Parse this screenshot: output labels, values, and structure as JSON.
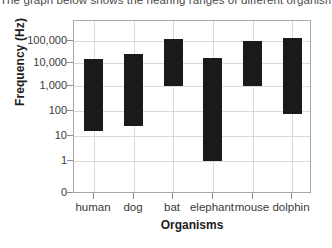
{
  "caption": {
    "text": "The graph below shows the hearing ranges of different organisms."
  },
  "chart_data": {
    "type": "bar",
    "title": "",
    "subtitle": "",
    "xlabel": "Organisms",
    "ylabel": "Frequency (Hz)",
    "categories": [
      "human",
      "dog",
      "bat",
      "elephant",
      "mouse",
      "dolphin"
    ],
    "series": [
      {
        "name": "Hearing range (Hz)",
        "ranges": [
          {
            "category": "human",
            "low": 16,
            "high": 16000
          },
          {
            "category": "dog",
            "low": 25,
            "high": 25000
          },
          {
            "category": "bat",
            "low": 1000,
            "high": 120000
          },
          {
            "category": "elephant",
            "low": 1,
            "high": 17000
          },
          {
            "category": "mouse",
            "low": 1000,
            "high": 100000
          },
          {
            "category": "dolphin",
            "low": 70,
            "high": 130000
          }
        ]
      }
    ],
    "yscale": "log-with-zero",
    "ytick_labels": [
      "100,000",
      "10,000",
      "1,000",
      "100",
      "10",
      "1",
      "0"
    ],
    "ytick_values": [
      100000,
      10000,
      1000,
      100,
      10,
      1,
      0
    ],
    "ylim": [
      0,
      400000
    ],
    "grid": true,
    "legend": "none",
    "bar_color": "#1a1a1a",
    "grid_color": "#d9d9d9",
    "frame_color": "#a8a8a8"
  }
}
